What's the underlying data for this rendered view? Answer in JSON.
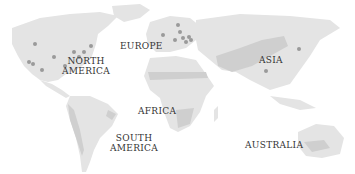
{
  "map": {
    "colors": {
      "land": "#e4e4e4",
      "land_dark": "#cfcfcf",
      "dot": "#9a9a9a",
      "label": "#333333"
    },
    "regions": [
      {
        "id": "north-america",
        "label": "NORTH\nAMERICA",
        "x": 75,
        "y": 56
      },
      {
        "id": "europe",
        "label": "EUROPE",
        "x": 123,
        "y": 41
      },
      {
        "id": "asia",
        "label": "ASIA",
        "x": 259,
        "y": 55
      },
      {
        "id": "africa",
        "label": "AFRICA",
        "x": 138,
        "y": 105
      },
      {
        "id": "south-america",
        "label": "SOUTH\nAMERICA",
        "x": 112,
        "y": 133
      },
      {
        "id": "australia",
        "label": "AUSTRALIA",
        "x": 245,
        "y": 140
      }
    ]
  }
}
